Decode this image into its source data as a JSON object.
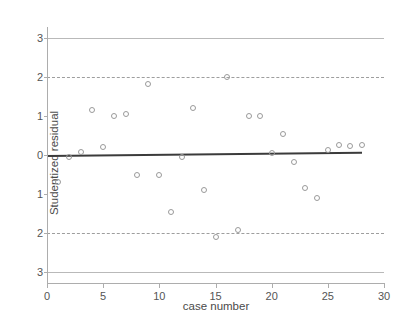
{
  "chart_data": {
    "type": "scatter",
    "title": "",
    "xlabel": "case number",
    "ylabel": "Studentized residual",
    "xlim": [
      0,
      30
    ],
    "ylim": [
      -3.2,
      3.2
    ],
    "grid": false,
    "legend": null,
    "xticks": [
      0,
      5,
      10,
      15,
      20,
      25,
      30
    ],
    "xtick_labels": [
      "0",
      "5",
      "10",
      "15",
      "20",
      "25",
      "30"
    ],
    "yticks": [
      3,
      2,
      1,
      0,
      -1,
      -2,
      -3
    ],
    "ytick_labels": [
      "3",
      "2",
      "1",
      "0",
      "1",
      "2",
      "3"
    ],
    "marker": "open-circle",
    "marker_color": "#9a9a9a",
    "x": [
      1,
      2,
      3,
      4,
      5,
      6,
      7,
      8,
      9,
      10,
      11,
      12,
      13,
      14,
      15,
      16,
      17,
      18,
      19,
      20,
      21,
      22,
      23,
      24,
      25,
      26,
      27,
      28
    ],
    "y": [
      -0.7,
      -0.05,
      0.07,
      1.15,
      0.21,
      0.99,
      1.05,
      -0.5,
      1.82,
      -0.52,
      -1.45,
      -0.04,
      1.2,
      -0.9,
      -2.1,
      2.0,
      -1.92,
      1.0,
      1.01,
      0.05,
      0.55,
      -0.18,
      -0.85,
      -1.1,
      0.13,
      0.25,
      0.24,
      0.26
    ],
    "reference_lines": [
      {
        "value": 3,
        "style": "solid",
        "color": "#b9b9b9",
        "label": "+3"
      },
      {
        "value": 2,
        "style": "dashed",
        "color": "#9e9e9e",
        "label": "+2"
      },
      {
        "value": -2,
        "style": "dashed",
        "color": "#9e9e9e",
        "label": "-2"
      },
      {
        "value": -3,
        "style": "solid",
        "color": "#b9b9b9",
        "label": "-3"
      }
    ],
    "fit_line": {
      "style": "solid",
      "color": "#3b3b3b",
      "y_at_xmin": 0.0,
      "y_at_xmax": 0.08,
      "x_start": 0,
      "x_end": 28
    }
  }
}
